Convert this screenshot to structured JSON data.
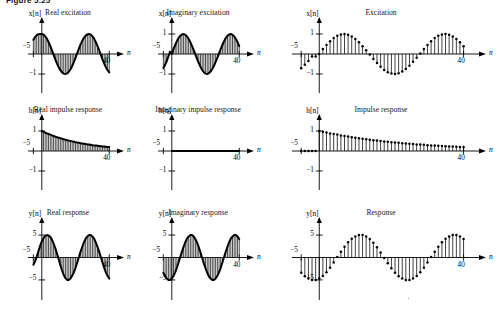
{
  "figure": {
    "caption": "Figure 5.25",
    "background": "#ffffff",
    "ink": "#000000"
  },
  "axis_symbols": {
    "n": "n",
    "x_of_n": "x[n]",
    "h_of_n": "h[n]",
    "y_of_n": "y[n]"
  },
  "panels": [
    {
      "id": "real-excitation",
      "title": "Real excitation",
      "style": "filled",
      "ylabel": "x[n]",
      "xlabel": "n",
      "xticks": [
        {
          "value": -5,
          "label": "−5"
        },
        {
          "value": 40,
          "label": "40"
        }
      ],
      "yticks": [
        {
          "value": -1,
          "label": "−1"
        }
      ],
      "xlim": [
        -7,
        44
      ],
      "ylim": [
        -1.35,
        1.35
      ]
    },
    {
      "id": "imaginary-excitation",
      "title": "Imaginary excitation",
      "style": "filled",
      "ylabel": "x[n]",
      "xlabel": "n",
      "xticks": [
        {
          "value": -5,
          "label": "−5"
        },
        {
          "value": 40,
          "label": "40"
        }
      ],
      "yticks": [
        {
          "value": 1,
          "label": "1"
        },
        {
          "value": -1,
          "label": "−1"
        }
      ],
      "xlim": [
        -7,
        44
      ],
      "ylim": [
        -1.35,
        1.35
      ]
    },
    {
      "id": "excitation",
      "title": "Excitation",
      "style": "stem",
      "ylabel": "x[n]",
      "xlabel": "n",
      "xticks": [
        {
          "value": -5,
          "label": "−5"
        },
        {
          "value": 40,
          "label": "40"
        }
      ],
      "yticks": [
        {
          "value": 1,
          "label": "1"
        },
        {
          "value": -1,
          "label": "−1"
        }
      ],
      "xlim": [
        -7,
        44
      ],
      "ylim": [
        -1.35,
        1.35
      ]
    },
    {
      "id": "real-impulse-response",
      "title": "Real impulse response",
      "style": "filled",
      "ylabel": "h[n]",
      "xlabel": "n",
      "xticks": [
        {
          "value": -5,
          "label": "−5"
        },
        {
          "value": 40,
          "label": "40"
        }
      ],
      "yticks": [
        {
          "value": 1,
          "label": "1"
        },
        {
          "value": -1,
          "label": "−1"
        }
      ],
      "xlim": [
        -7,
        44
      ],
      "ylim": [
        -1.35,
        1.35
      ]
    },
    {
      "id": "imaginary-impulse-response",
      "title": "Imaginary impulse response",
      "style": "filled",
      "ylabel": "h[n]",
      "xlabel": "n",
      "xticks": [
        {
          "value": -5,
          "label": "−5"
        },
        {
          "value": 40,
          "label": "40"
        }
      ],
      "yticks": [
        {
          "value": 1,
          "label": "1"
        },
        {
          "value": -1,
          "label": "−1"
        }
      ],
      "xlim": [
        -7,
        44
      ],
      "ylim": [
        -1.35,
        1.35
      ]
    },
    {
      "id": "impulse-response",
      "title": "Impulse response",
      "style": "stem",
      "ylabel": "h[n]",
      "xlabel": "n",
      "xticks": [
        {
          "value": -5,
          "label": "−5"
        },
        {
          "value": 40,
          "label": "40"
        }
      ],
      "yticks": [
        {
          "value": 1,
          "label": "1"
        },
        {
          "value": -1,
          "label": "−1"
        }
      ],
      "xlim": [
        -7,
        44
      ],
      "ylim": [
        -1.35,
        1.35
      ]
    },
    {
      "id": "real-response",
      "title": "Real response",
      "style": "filled",
      "ylabel": "y[n]",
      "xlabel": "n",
      "xticks": [
        {
          "value": -5,
          "label": "−5"
        },
        {
          "value": 40,
          "label": "40"
        }
      ],
      "yticks": [
        {
          "value": 5,
          "label": "5"
        },
        {
          "value": -5,
          "label": "−5"
        }
      ],
      "xlim": [
        -7,
        44
      ],
      "ylim": [
        -6.8,
        6.8
      ]
    },
    {
      "id": "imaginary-response",
      "title": "Imaginary response",
      "style": "filled",
      "ylabel": "y[n]",
      "xlabel": "n",
      "xticks": [
        {
          "value": -5,
          "label": "−5"
        },
        {
          "value": 40,
          "label": "40"
        }
      ],
      "yticks": [
        {
          "value": 5,
          "label": "5"
        },
        {
          "value": -5,
          "label": "−5"
        }
      ],
      "xlim": [
        -7,
        44
      ],
      "ylim": [
        -6.8,
        6.8
      ]
    },
    {
      "id": "response",
      "title": "Response",
      "style": "stem",
      "ylabel": "y[n]",
      "xlabel": "n",
      "xticks": [
        {
          "value": -5,
          "label": "−5"
        },
        {
          "value": 40,
          "label": "40"
        }
      ],
      "yticks": [
        {
          "value": 5,
          "label": "5"
        },
        {
          "value": -5,
          "label": "−5"
        }
      ],
      "xlim": [
        -7,
        44
      ],
      "ylim": [
        -6.8,
        6.8
      ]
    }
  ],
  "chart_data": [
    {
      "type": "bar",
      "id": "real-excitation",
      "title": "Real excitation",
      "xlabel": "n",
      "ylabel": "x[n]",
      "xlim": [
        -7,
        44
      ],
      "ylim": [
        -1.35,
        1.35
      ],
      "grid": false,
      "legend": null,
      "note": "cos(2*pi*n/25) for n >= -5, unit amplitude, stem/filled bars",
      "formula": "cos(2*pi*n/25)",
      "x": [
        -5,
        -4,
        -3,
        -2,
        -1,
        0,
        1,
        2,
        3,
        4,
        5,
        6,
        7,
        8,
        9,
        10,
        11,
        12,
        13,
        14,
        15,
        16,
        17,
        18,
        19,
        20,
        21,
        22,
        23,
        24,
        25,
        26,
        27,
        28,
        29,
        30,
        31,
        32,
        33,
        34,
        35,
        36,
        37,
        38,
        39,
        40
      ],
      "values": [
        0.71,
        0.84,
        0.94,
        0.99,
        1.0,
        1.0,
        0.97,
        0.89,
        0.77,
        0.6,
        0.41,
        0.19,
        -0.04,
        -0.27,
        -0.48,
        -0.66,
        -0.81,
        -0.92,
        -0.98,
        -1.0,
        -0.97,
        -0.89,
        -0.77,
        -0.6,
        -0.41,
        -0.19,
        0.04,
        0.27,
        0.48,
        0.66,
        0.81,
        0.92,
        0.98,
        1.0,
        0.97,
        0.89,
        0.77,
        0.6,
        0.41,
        0.19,
        -0.04,
        -0.27,
        -0.48,
        -0.66,
        -0.81,
        -0.92
      ]
    },
    {
      "type": "bar",
      "id": "imaginary-excitation",
      "title": "Imaginary excitation",
      "xlabel": "n",
      "ylabel": "x[n]",
      "xlim": [
        -7,
        44
      ],
      "ylim": [
        -1.35,
        1.35
      ],
      "grid": false,
      "legend": null,
      "formula": "sin(2*pi*n/25)",
      "x": [
        -5,
        -4,
        -3,
        -2,
        -1,
        0,
        1,
        2,
        3,
        4,
        5,
        6,
        7,
        8,
        9,
        10,
        11,
        12,
        13,
        14,
        15,
        16,
        17,
        18,
        19,
        20,
        21,
        22,
        23,
        24,
        25,
        26,
        27,
        28,
        29,
        30,
        31,
        32,
        33,
        34,
        35,
        36,
        37,
        38,
        39,
        40
      ],
      "values": [
        -0.71,
        -0.54,
        -0.35,
        -0.12,
        0.12,
        0.0,
        0.25,
        0.45,
        0.64,
        0.8,
        0.91,
        0.98,
        1.0,
        0.96,
        0.88,
        0.75,
        0.59,
        0.39,
        0.19,
        -0.03,
        -0.25,
        -0.45,
        -0.64,
        -0.8,
        -0.91,
        -0.98,
        -1.0,
        -0.96,
        -0.88,
        -0.75,
        -0.59,
        -0.39,
        -0.19,
        0.03,
        0.25,
        0.45,
        0.64,
        0.8,
        0.91,
        0.98,
        1.0,
        0.96,
        0.88,
        0.75,
        0.59,
        0.39
      ]
    },
    {
      "type": "scatter",
      "id": "excitation",
      "title": "Excitation",
      "xlabel": "n",
      "ylabel": "x[n]",
      "xlim": [
        -7,
        44
      ],
      "ylim": [
        -1.35,
        1.35
      ],
      "grid": false,
      "legend": null,
      "note": "stem plot with dot markers; magnitude/real part of complex excitation",
      "x": [
        -5,
        -4,
        -3,
        -2,
        -1,
        0,
        1,
        2,
        3,
        4,
        5,
        6,
        7,
        8,
        9,
        10,
        11,
        12,
        13,
        14,
        15,
        16,
        17,
        18,
        19,
        20,
        21,
        22,
        23,
        24,
        25,
        26,
        27,
        28,
        29,
        30,
        31,
        32,
        33,
        34,
        35,
        36,
        37,
        38,
        39,
        40
      ],
      "values": [
        -0.71,
        -0.54,
        -0.35,
        -0.12,
        -0.12,
        0.0,
        0.25,
        0.45,
        0.64,
        0.8,
        0.91,
        0.98,
        1.0,
        0.96,
        0.88,
        0.75,
        0.59,
        0.39,
        0.19,
        -0.03,
        -0.25,
        -0.45,
        -0.64,
        -0.8,
        -0.91,
        -0.98,
        -1.0,
        -0.96,
        -0.88,
        -0.75,
        -0.59,
        -0.39,
        -0.19,
        0.03,
        0.25,
        0.45,
        0.64,
        0.8,
        0.91,
        0.98,
        1.0,
        0.96,
        0.88,
        0.75,
        0.59,
        0.39
      ]
    },
    {
      "type": "bar",
      "id": "real-impulse-response",
      "title": "Real impulse response",
      "xlabel": "n",
      "ylabel": "h[n]",
      "xlim": [
        -7,
        44
      ],
      "ylim": [
        -1.35,
        1.35
      ],
      "grid": false,
      "legend": null,
      "formula": "0.96^n * u[n]",
      "x": [
        0,
        1,
        2,
        3,
        4,
        5,
        6,
        7,
        8,
        9,
        10,
        11,
        12,
        13,
        14,
        15,
        16,
        17,
        18,
        19,
        20,
        21,
        22,
        23,
        24,
        25,
        26,
        27,
        28,
        29,
        30,
        31,
        32,
        33,
        34,
        35,
        36,
        37,
        38,
        39,
        40
      ],
      "values": [
        1.0,
        0.96,
        0.92,
        0.88,
        0.85,
        0.82,
        0.78,
        0.75,
        0.72,
        0.69,
        0.66,
        0.64,
        0.61,
        0.59,
        0.56,
        0.54,
        0.52,
        0.5,
        0.48,
        0.46,
        0.44,
        0.42,
        0.41,
        0.39,
        0.37,
        0.36,
        0.35,
        0.33,
        0.32,
        0.31,
        0.29,
        0.28,
        0.27,
        0.26,
        0.25,
        0.24,
        0.23,
        0.22,
        0.21,
        0.2,
        0.2
      ]
    },
    {
      "type": "bar",
      "id": "imaginary-impulse-response",
      "title": "Imaginary impulse response",
      "xlabel": "n",
      "ylabel": "h[n]",
      "xlim": [
        -7,
        44
      ],
      "ylim": [
        -1.35,
        1.35
      ],
      "grid": false,
      "legend": null,
      "note": "all zero",
      "x": [
        0,
        1,
        2,
        3,
        4,
        5,
        6,
        7,
        8,
        9,
        10,
        11,
        12,
        13,
        14,
        15,
        16,
        17,
        18,
        19,
        20,
        21,
        22,
        23,
        24,
        25,
        26,
        27,
        28,
        29,
        30,
        31,
        32,
        33,
        34,
        35,
        36,
        37,
        38,
        39,
        40
      ],
      "values": [
        0,
        0,
        0,
        0,
        0,
        0,
        0,
        0,
        0,
        0,
        0,
        0,
        0,
        0,
        0,
        0,
        0,
        0,
        0,
        0,
        0,
        0,
        0,
        0,
        0,
        0,
        0,
        0,
        0,
        0,
        0,
        0,
        0,
        0,
        0,
        0,
        0,
        0,
        0,
        0,
        0
      ]
    },
    {
      "type": "scatter",
      "id": "impulse-response",
      "title": "Impulse response",
      "xlabel": "n",
      "ylabel": "h[n]",
      "xlim": [
        -7,
        44
      ],
      "ylim": [
        -1.35,
        1.35
      ],
      "grid": false,
      "legend": null,
      "note": "stem plot with dot markers; decaying exponential, zero for n<0",
      "x": [
        -5,
        -4,
        -3,
        -2,
        -1,
        0,
        1,
        2,
        3,
        4,
        5,
        6,
        7,
        8,
        9,
        10,
        11,
        12,
        13,
        14,
        15,
        16,
        17,
        18,
        19,
        20,
        21,
        22,
        23,
        24,
        25,
        26,
        27,
        28,
        29,
        30,
        31,
        32,
        33,
        34,
        35,
        36,
        37,
        38,
        39,
        40
      ],
      "values": [
        0,
        0,
        0,
        0,
        0,
        1.0,
        0.96,
        0.92,
        0.88,
        0.85,
        0.82,
        0.78,
        0.75,
        0.72,
        0.69,
        0.66,
        0.64,
        0.61,
        0.59,
        0.56,
        0.54,
        0.52,
        0.5,
        0.48,
        0.46,
        0.44,
        0.42,
        0.41,
        0.39,
        0.37,
        0.36,
        0.35,
        0.33,
        0.32,
        0.31,
        0.29,
        0.28,
        0.27,
        0.26,
        0.25,
        0.24,
        0.23,
        0.22,
        0.21,
        0.2,
        0.2
      ]
    },
    {
      "type": "bar",
      "id": "real-response",
      "title": "Real response",
      "xlabel": "n",
      "ylabel": "y[n]",
      "xlim": [
        -7,
        44
      ],
      "ylim": [
        -6.8,
        6.8
      ],
      "grid": false,
      "legend": null,
      "note": "convolution of real excitation with impulse response; amplitude about 5",
      "x": [
        -5,
        -4,
        -3,
        -2,
        -1,
        0,
        1,
        2,
        3,
        4,
        5,
        6,
        7,
        8,
        9,
        10,
        11,
        12,
        13,
        14,
        15,
        16,
        17,
        18,
        19,
        20,
        21,
        22,
        23,
        24,
        25,
        26,
        27,
        28,
        29,
        30,
        31,
        32,
        33,
        34,
        35,
        36,
        37,
        38,
        39,
        40
      ],
      "values": [
        -1.6,
        -0.9,
        0.2,
        1.4,
        2.6,
        3.6,
        4.3,
        4.8,
        5.0,
        4.9,
        4.6,
        4.0,
        3.1,
        2.1,
        0.9,
        -0.4,
        -1.7,
        -2.9,
        -3.9,
        -4.6,
        -5.0,
        -5.0,
        -4.7,
        -4.1,
        -3.3,
        -2.3,
        -1.1,
        0.1,
        1.3,
        2.4,
        3.4,
        4.2,
        4.7,
        5.0,
        5.0,
        4.7,
        4.2,
        3.4,
        2.4,
        1.3,
        0.1,
        -1.1,
        -2.3,
        -3.3,
        -4.1,
        -4.7
      ]
    },
    {
      "type": "bar",
      "id": "imaginary-response",
      "title": "Imaginary response",
      "xlabel": "n",
      "ylabel": "y[n]",
      "xlim": [
        -7,
        44
      ],
      "ylim": [
        -6.8,
        6.8
      ],
      "grid": false,
      "legend": null,
      "note": "convolution of imaginary excitation with impulse response",
      "x": [
        -5,
        -4,
        -3,
        -2,
        -1,
        0,
        1,
        2,
        3,
        4,
        5,
        6,
        7,
        8,
        9,
        10,
        11,
        12,
        13,
        14,
        15,
        16,
        17,
        18,
        19,
        20,
        21,
        22,
        23,
        24,
        25,
        26,
        27,
        28,
        29,
        30,
        31,
        32,
        33,
        34,
        35,
        36,
        37,
        38,
        39,
        40
      ],
      "values": [
        -3.4,
        -4.2,
        -4.7,
        -5.0,
        -5.0,
        -4.7,
        -4.1,
        -3.3,
        -2.3,
        -1.1,
        0.1,
        1.3,
        2.4,
        3.4,
        4.2,
        4.7,
        5.0,
        5.0,
        4.7,
        4.1,
        3.3,
        2.3,
        1.1,
        -0.1,
        -1.3,
        -2.4,
        -3.4,
        -4.2,
        -4.7,
        -5.0,
        -5.0,
        -4.7,
        -4.1,
        -3.3,
        -2.3,
        -1.1,
        0.1,
        1.3,
        2.4,
        3.4,
        4.2,
        4.7,
        5.0,
        5.0,
        4.7,
        4.1
      ]
    },
    {
      "type": "scatter",
      "id": "response",
      "title": "Response",
      "xlabel": "n",
      "ylabel": "y[n]",
      "xlim": [
        -7,
        44
      ],
      "ylim": [
        -6.8,
        6.8
      ],
      "grid": false,
      "legend": null,
      "note": "stem plot with dot markers",
      "x": [
        -5,
        -4,
        -3,
        -2,
        -1,
        0,
        1,
        2,
        3,
        4,
        5,
        6,
        7,
        8,
        9,
        10,
        11,
        12,
        13,
        14,
        15,
        16,
        17,
        18,
        19,
        20,
        21,
        22,
        23,
        24,
        25,
        26,
        27,
        28,
        29,
        30,
        31,
        32,
        33,
        34,
        35,
        36,
        37,
        38,
        39,
        40
      ],
      "values": [
        -3.4,
        -4.2,
        -4.7,
        -5.0,
        -5.0,
        -4.7,
        -4.1,
        -3.3,
        -2.3,
        -1.1,
        0.1,
        1.3,
        2.4,
        3.4,
        4.2,
        4.7,
        5.0,
        5.0,
        4.7,
        4.1,
        3.3,
        2.3,
        1.1,
        -0.1,
        -1.3,
        -2.4,
        -3.4,
        -4.2,
        -4.7,
        -5.0,
        -5.0,
        -4.7,
        -4.1,
        -3.3,
        -2.3,
        -1.1,
        0.1,
        1.3,
        2.4,
        3.4,
        4.2,
        4.7,
        5.0,
        5.0,
        4.7,
        4.1
      ]
    }
  ]
}
